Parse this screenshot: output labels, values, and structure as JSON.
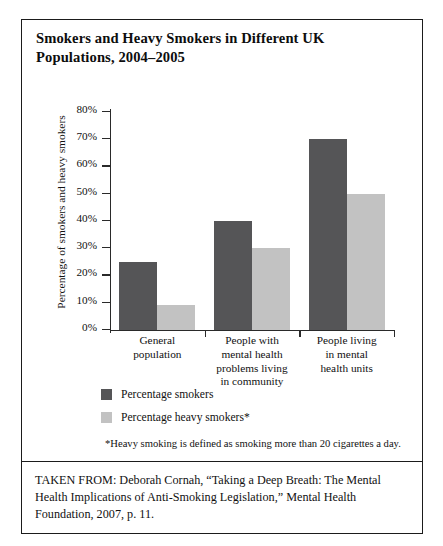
{
  "figure": {
    "title": "Smokers and Heavy Smokers in Different UK Populations, 2004–2005",
    "footnote": "*Heavy smoking is defined as smoking more than 20 cigarettes a day.",
    "citation": "TAKEN FROM: Deborah Cornah, “Taking a Deep Breath: The Mental Health Implications of Anti-Smoking Legislation,” Mental Health Foundation, 2007, p. 11."
  },
  "chart_data": {
    "type": "bar",
    "title": "Smokers and Heavy Smokers in Different UK Populations, 2004–2005",
    "xlabel": "",
    "ylabel": "Percentage of smokers and heavy smokers",
    "ylim": [
      0,
      80
    ],
    "yticks": [
      "0%",
      "10%",
      "20%",
      "30%",
      "40%",
      "50%",
      "60%",
      "70%",
      "80%"
    ],
    "ytick_values": [
      0,
      10,
      20,
      30,
      40,
      50,
      60,
      70,
      80
    ],
    "grid": false,
    "legend_position": "below-plot-left",
    "categories": [
      "General population",
      "People with mental health problems living in community",
      "People living in mental health units"
    ],
    "category_lines": [
      [
        "General",
        "population"
      ],
      [
        "People with",
        "mental health",
        "problems living",
        "in community"
      ],
      [
        "People living",
        "in mental",
        "health units"
      ]
    ],
    "series": [
      {
        "name": "Percentage smokers",
        "color": "#555557",
        "values": [
          25,
          40,
          70
        ]
      },
      {
        "name": "Percentage heavy smokers*",
        "color": "#c2c2c2",
        "values": [
          9,
          30,
          50
        ]
      }
    ]
  }
}
